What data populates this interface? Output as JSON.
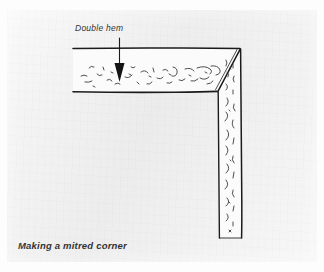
{
  "figure": {
    "caption": "Making a mitred corner",
    "annotations": [
      {
        "id": "double-hem",
        "label": "Double hem",
        "pointer": "down-arrow",
        "target": "hem band"
      }
    ],
    "illustration": {
      "subject": "fabric corner with double hem, mitred",
      "style": "pen line drawing",
      "elements": [
        "top hem band",
        "side hem band",
        "mitre diagonal seam",
        "fabric body",
        "fabric texture squiggles"
      ]
    },
    "colors": {
      "paper": "#f1f1f2",
      "ink": "#1b1b1b",
      "fabric": "#fcfcfc",
      "page": "#fdfdfd"
    }
  }
}
